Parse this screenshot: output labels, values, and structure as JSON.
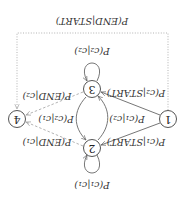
{
  "diagram": {
    "orientation": "rotated-180",
    "nodes": [
      {
        "id": "1",
        "label": "1"
      },
      {
        "id": "2",
        "label": "2"
      },
      {
        "id": "3",
        "label": "3"
      },
      {
        "id": "4",
        "label": "4"
      }
    ],
    "edges": {
      "start_to_c1": "P(c₁|START)",
      "start_to_c2": "P(c₂|START)",
      "c1_to_c1": "P(c₁|c₁)",
      "c2_to_c2": "P(c₂|c₂)",
      "c1_to_c2": "P(c₂|c₁)",
      "c2_to_c1": "P(c₁|c₂)",
      "c1_to_end": "P(END|c₁)",
      "c2_to_end": "P(END|c₂)",
      "start_to_end": "P(END|START)"
    },
    "colors": {
      "solid_edge": "#666666",
      "dashed_edge": "#aaaaaa",
      "node_stroke": "#555555"
    }
  }
}
